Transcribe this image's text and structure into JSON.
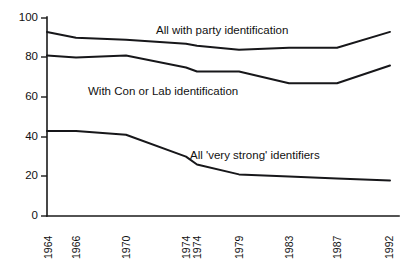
{
  "chart_data": {
    "type": "line",
    "title": "",
    "subtitle": "",
    "xlabel": "",
    "ylabel": "",
    "grid": false,
    "legend_position": "inline-annotations",
    "x": [
      "1964",
      "1966",
      "1970",
      "1974",
      "1974",
      "1979",
      "1983",
      "1987",
      "1992"
    ],
    "xtick_labels": [
      "1964",
      "1966",
      "1970",
      "1974",
      "1974",
      "1979",
      "1983",
      "1987",
      "1992"
    ],
    "xtick_rotation": -90,
    "ytick_labels": [
      "100",
      "80",
      "60",
      "40",
      "20",
      "0"
    ],
    "ytick_values": [
      100,
      80,
      60,
      40,
      20,
      0
    ],
    "ylim": [
      0,
      100
    ],
    "series": [
      {
        "name": "All with party identification",
        "values": [
          93,
          90,
          89,
          87,
          86,
          84,
          85,
          85,
          93
        ]
      },
      {
        "name": "With Con or Lab identification",
        "values": [
          81,
          80,
          81,
          75,
          73,
          73,
          67,
          67,
          76
        ]
      },
      {
        "name": "All 'very strong' identifiers",
        "values": [
          43,
          43,
          41,
          30,
          26,
          21,
          20,
          19,
          18
        ]
      }
    ],
    "annotations": [
      {
        "text": "All with party identification",
        "x_px": 156,
        "y_px": 31
      },
      {
        "text": "With Con or Lab identification",
        "x_px": 88,
        "y_px": 92
      },
      {
        "text": "All 'very strong' identifiers",
        "x_px": 190,
        "y_px": 156
      }
    ],
    "colors": {
      "line": "#17171a",
      "axis": "#1a1a1a",
      "background": "#ffffff"
    }
  }
}
